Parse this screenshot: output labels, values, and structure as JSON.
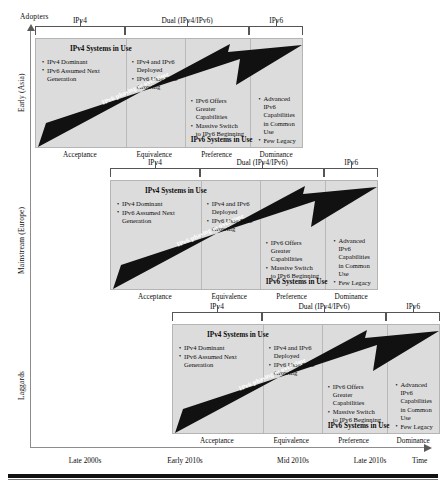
{
  "axes": {
    "y_title": "Adopters",
    "x_title": "Time",
    "y_ticks": [
      "Early (Asia)",
      "Mainstream (Europe)",
      "Laggards"
    ],
    "x_ticks": [
      "Late 2000s",
      "Early 2010s",
      "Mid 2010s",
      "Late 2010s"
    ]
  },
  "phases": [
    {
      "label": "IPv4"
    },
    {
      "label": "Dual (IPv4/IPv6)"
    },
    {
      "label": "IPv6"
    }
  ],
  "stages": [
    "Acceptance",
    "Equivalence",
    "Preference",
    "Dominance"
  ],
  "panel": {
    "top_header": "IPv4 Systems in Use",
    "bottom_header": "IPv6 Systems in Use",
    "arrow_text": "IPv6 phasing in over time",
    "columns": [
      {
        "name": "acceptance",
        "bullets": [
          "IPv4 Dominant",
          "IPv6 Assumed Next Generation"
        ]
      },
      {
        "name": "equivalence",
        "bullets": [
          "IPv4 and IPv6 Deployed",
          "IPv6 User Base Growing"
        ]
      },
      {
        "name": "preference",
        "bullets": [
          "IPv6 Offers Greater Capabilities",
          "Massive Switch to IPv6 Beginning"
        ]
      },
      {
        "name": "dominance",
        "bullets": [
          "Advanced IPv6 Capabilities in Common Use",
          "Few Legacy IPv4 Systems Remain"
        ]
      }
    ]
  },
  "colors": {
    "panel_fill": "#dcdcdc",
    "panel_border": "#b4b4b4",
    "arrow": "#111111",
    "axis": "#8c8c8c",
    "text": "#0d0d0d"
  },
  "blocks": [
    {
      "row": "Early (Asia)",
      "left": 35,
      "top": 16
    },
    {
      "row": "Mainstream (Europe)",
      "left": 110,
      "top": 158
    },
    {
      "row": "Laggards",
      "left": 172,
      "top": 302
    }
  ]
}
